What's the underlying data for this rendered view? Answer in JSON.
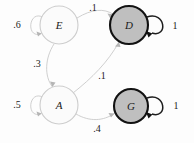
{
  "diagram": {
    "type": "state-transition-diagram",
    "title": "",
    "colors": {
      "plain_node_fill": "#fbfbfb",
      "plain_node_stroke": "#cdcdcd",
      "accept_node_fill": "#bfbfbf",
      "accept_node_stroke": "#121212",
      "light_edge": "#c9c9c9",
      "dark_edge": "#1d1d1d",
      "background": "#fdfdfd"
    },
    "nodes": [
      {
        "id": "E",
        "label": "E",
        "cx": 59,
        "cy": 25,
        "r": 19,
        "style": "plain"
      },
      {
        "id": "D",
        "label": "D",
        "cx": 129,
        "cy": 25,
        "r": 19,
        "style": "accept"
      },
      {
        "id": "A",
        "label": "A",
        "cx": 59,
        "cy": 105,
        "r": 19,
        "style": "plain"
      },
      {
        "id": "G",
        "label": "G",
        "cx": 131,
        "cy": 106,
        "r": 17,
        "style": "accept"
      }
    ],
    "edges": [
      {
        "id": "e-self",
        "from": "E",
        "to": "E",
        "label": ".6",
        "label_x": 17,
        "label_y": 24,
        "style": "light"
      },
      {
        "id": "e-to-d",
        "from": "E",
        "to": "D",
        "label": ".1",
        "label_x": 93,
        "label_y": 7,
        "style": "light"
      },
      {
        "id": "e-to-a",
        "from": "E",
        "to": "A",
        "label": ".3",
        "label_x": 37,
        "label_y": 63,
        "style": "light"
      },
      {
        "id": "a-self",
        "from": "A",
        "to": "A",
        "label": ".5",
        "label_x": 17,
        "label_y": 104,
        "style": "light"
      },
      {
        "id": "a-to-d",
        "from": "A",
        "to": "D",
        "label": ".1",
        "label_x": 102,
        "label_y": 75,
        "style": "light"
      },
      {
        "id": "a-to-g",
        "from": "A",
        "to": "G",
        "label": ".4",
        "label_x": 97,
        "label_y": 128,
        "style": "light"
      },
      {
        "id": "d-self",
        "from": "D",
        "to": "D",
        "label": "1",
        "label_x": 175,
        "label_y": 25,
        "style": "dark"
      },
      {
        "id": "g-self",
        "from": "G",
        "to": "G",
        "label": "1",
        "label_x": 176,
        "label_y": 105,
        "style": "dark"
      }
    ]
  }
}
